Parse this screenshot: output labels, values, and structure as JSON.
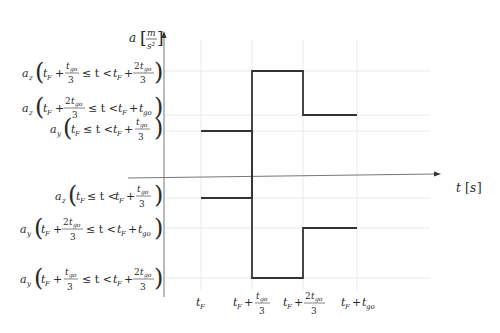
{
  "diagram": {
    "y_axis_label": "a [m/s²]",
    "x_axis_label": "t [s]",
    "y_labels": [
      {
        "id": "az_mid",
        "text": "a_z(t_F + t_go/3 ≤ t < t_F + 2t_go/3)",
        "y": 71
      },
      {
        "id": "az_last",
        "text": "a_z(t_F + 2t_go/3 ≤ t < t_F + t_go)",
        "y": 115
      },
      {
        "id": "ay_first",
        "text": "a_y(t_F ≤ t < t_F + t_go/3)",
        "y": 131
      },
      {
        "id": "az_first",
        "text": "a_z(t_F ≤ t < t_F + t_go/3)",
        "y": 198
      },
      {
        "id": "ay_last",
        "text": "a_y(t_F + 2t_go/3 ≤ t < t_F + t_go)",
        "y": 228
      },
      {
        "id": "ay_mid",
        "text": "a_y(t_F + t_go/3 ≤ t < t_F + 2t_go/3)",
        "y": 278
      }
    ],
    "x_ticks": [
      {
        "text": "t_F",
        "x": 201
      },
      {
        "text": "t_F + t_go/3",
        "x": 252
      },
      {
        "text": "t_F + 2t_go/3",
        "x": 303
      },
      {
        "text": "t_F + t_go",
        "x": 357
      }
    ],
    "series": [
      {
        "name": "a_y",
        "segments": [
          {
            "x0": 201,
            "x1": 252,
            "y": 131
          },
          {
            "x0": 252,
            "x1": 303,
            "y": 278
          },
          {
            "x0": 303,
            "x1": 357,
            "y": 228
          }
        ]
      },
      {
        "name": "a_z",
        "segments": [
          {
            "x0": 201,
            "x1": 252,
            "y": 198
          },
          {
            "x0": 252,
            "x1": 303,
            "y": 71
          },
          {
            "x0": 303,
            "x1": 357,
            "y": 115
          }
        ]
      }
    ]
  }
}
